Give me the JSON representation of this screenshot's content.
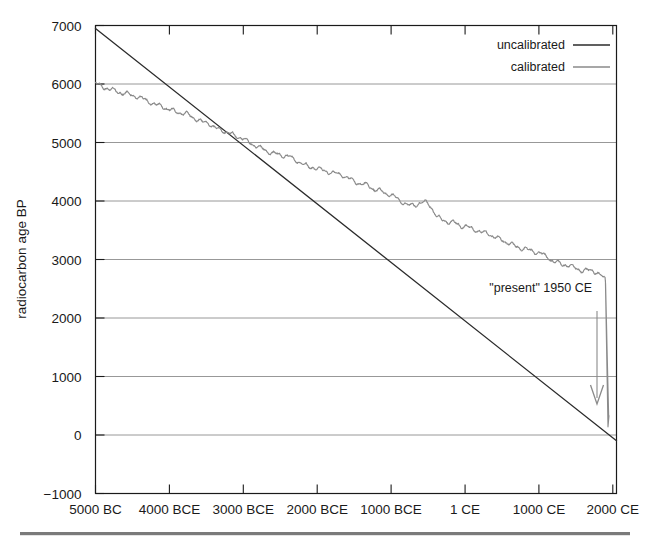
{
  "figure": {
    "background_color": "#ffffff",
    "frame_color": "#1a1a1a",
    "grid_color": "#8c8c8c",
    "bottom_rule_color": "#7a7a7a"
  },
  "chart_data": {
    "type": "line",
    "title": "",
    "xlabel": "",
    "ylabel": "radiocarbon age BP",
    "xlim": [
      -5000,
      2050
    ],
    "ylim": [
      -1000,
      7000
    ],
    "grid": true,
    "grid_axis": "y",
    "legend_position": "top-right",
    "x_tick_labels": [
      "5000 BC",
      "4000 BCE",
      "3000 BCE",
      "2000 BCE",
      "1000 BCE",
      "1 CE",
      "1000 CE",
      "2000 CE"
    ],
    "x_tick_values": [
      -5000,
      -4000,
      -3000,
      -2000,
      -1000,
      1,
      1000,
      2000
    ],
    "y_tick_labels": [
      "7000",
      "6000",
      "5000",
      "4000",
      "3000",
      "2000",
      "1000",
      "0",
      "-1000"
    ],
    "y_tick_values": [
      7000,
      6000,
      5000,
      4000,
      3000,
      2000,
      1000,
      0,
      -1000
    ],
    "y_gridline_values": [
      6000,
      5000,
      4000,
      3000,
      2000,
      1000,
      0
    ],
    "series": [
      {
        "name": "uncalibrated",
        "color": "#2b2b2b",
        "width": 1.3,
        "note": "straight line: radiocarbon age BP equals 1950 minus calendar year CE",
        "x": [
          -5000,
          2050
        ],
        "values": [
          6950,
          -100
        ]
      },
      {
        "name": "calibrated",
        "color": "#8a8a8a",
        "width": 1.2,
        "note": "IntCal-style calibration curve, radiocarbon age BP vs calendar year",
        "x": [
          -5000,
          -4950,
          -4900,
          -4850,
          -4800,
          -4750,
          -4700,
          -4650,
          -4600,
          -4550,
          -4500,
          -4450,
          -4400,
          -4350,
          -4300,
          -4250,
          -4200,
          -4150,
          -4100,
          -4050,
          -4000,
          -3950,
          -3900,
          -3850,
          -3800,
          -3750,
          -3700,
          -3650,
          -3600,
          -3550,
          -3500,
          -3450,
          -3400,
          -3350,
          -3300,
          -3250,
          -3200,
          -3150,
          -3100,
          -3050,
          -3000,
          -2950,
          -2900,
          -2850,
          -2800,
          -2750,
          -2700,
          -2650,
          -2600,
          -2550,
          -2500,
          -2450,
          -2400,
          -2350,
          -2300,
          -2250,
          -2200,
          -2150,
          -2100,
          -2050,
          -2000,
          -1950,
          -1900,
          -1850,
          -1800,
          -1750,
          -1700,
          -1650,
          -1600,
          -1550,
          -1500,
          -1450,
          -1400,
          -1350,
          -1300,
          -1250,
          -1200,
          -1150,
          -1100,
          -1050,
          -1000,
          -950,
          -900,
          -850,
          -800,
          -750,
          -700,
          -650,
          -600,
          -550,
          -500,
          -450,
          -400,
          -350,
          -300,
          -250,
          -200,
          -150,
          -100,
          -50,
          1,
          50,
          100,
          150,
          200,
          250,
          300,
          350,
          400,
          450,
          500,
          550,
          600,
          650,
          700,
          750,
          800,
          850,
          900,
          950,
          1000,
          1050,
          1100,
          1150,
          1200,
          1250,
          1300,
          1350,
          1400,
          1450,
          1500,
          1550,
          1600,
          1650,
          1700,
          1750,
          1800,
          1850,
          1900,
          1950
        ],
        "values": [
          6060,
          6020,
          5990,
          5965,
          5930,
          5905,
          5880,
          5860,
          5840,
          5810,
          5790,
          5770,
          5740,
          5715,
          5690,
          5665,
          5640,
          5620,
          5600,
          5570,
          5545,
          5525,
          5500,
          5480,
          5460,
          5440,
          5415,
          5390,
          5365,
          5345,
          5320,
          5295,
          5270,
          5245,
          5220,
          5195,
          5170,
          5150,
          5125,
          5100,
          5075,
          5050,
          5030,
          5005,
          4980,
          4955,
          4930,
          4905,
          4880,
          4855,
          4830,
          4805,
          4780,
          4760,
          4735,
          4710,
          4685,
          4660,
          4635,
          4610,
          4585,
          4560,
          4535,
          4510,
          4485,
          4460,
          4435,
          4410,
          4385,
          4360,
          4335,
          4310,
          4285,
          4260,
          4235,
          4210,
          4185,
          4160,
          4135,
          4110,
          4085,
          4060,
          4035,
          4010,
          3985,
          3960,
          3935,
          3910,
          3885,
          3860,
          3835,
          3810,
          3785,
          3760,
          3735,
          3710,
          3685,
          3660,
          3635,
          3610,
          3585,
          3560,
          3535,
          3510,
          3485,
          3460,
          3435,
          3410,
          3385,
          3360,
          3335,
          3310,
          3285,
          3260,
          3235,
          3210,
          3185,
          3160,
          3135,
          3110,
          3085,
          3060,
          3035,
          3010,
          2985,
          2960,
          2935,
          2910,
          2885,
          2860,
          2835,
          2810,
          2785,
          2760,
          2735,
          2710,
          2685,
          2660,
          2635,
          0
        ],
        "wiggle_note": "fine oscillations of roughly 20-80 radiocarbon years about the smooth trend; pronounced plateau near 800-400 BCE"
      }
    ],
    "annotations": [
      {
        "name": "present-marker",
        "text": "\"present\" 1950 CE",
        "x": 1950,
        "arrow": true,
        "arrow_from_y": 2200,
        "arrow_to_y": 500
      }
    ]
  },
  "legend": {
    "entries": [
      {
        "label": "uncalibrated",
        "color": "#2b2b2b"
      },
      {
        "label": "calibrated",
        "color": "#8a8a8a"
      }
    ]
  },
  "axis": {
    "y_title": "radiocarbon age BP"
  }
}
